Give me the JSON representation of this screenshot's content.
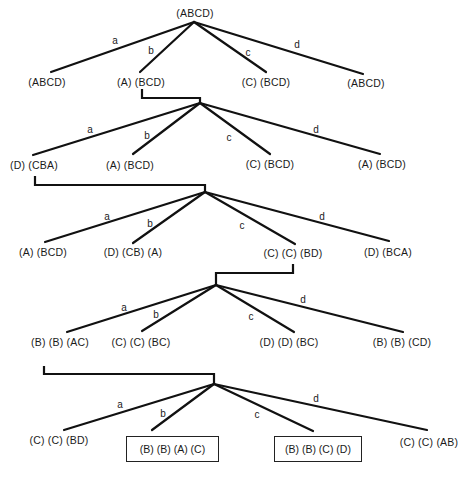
{
  "diagram": {
    "type": "decision-tree",
    "levels": [
      {
        "root": "(ABCD)",
        "branches": [
          {
            "edge": "a",
            "result": "(ABCD)"
          },
          {
            "edge": "b",
            "result": "(A) (BCD)"
          },
          {
            "edge": "c",
            "result": "(C) (BCD)"
          },
          {
            "edge": "d",
            "result": "(ABCD)"
          }
        ],
        "expanded_branch": "b"
      },
      {
        "root": "(A) (BCD)",
        "branches": [
          {
            "edge": "a",
            "result": "(D) (CBA)"
          },
          {
            "edge": "b",
            "result": "(A) (BCD)"
          },
          {
            "edge": "c",
            "result": "(C) (BCD)"
          },
          {
            "edge": "d",
            "result": "(A) (BCD)"
          }
        ],
        "expanded_branch": "a"
      },
      {
        "root": "(D) (CBA)",
        "branches": [
          {
            "edge": "a",
            "result": "(A) (BCD)"
          },
          {
            "edge": "b",
            "result": "(D) (CB) (A)"
          },
          {
            "edge": "c",
            "result": "(C) (C) (BD)"
          },
          {
            "edge": "d",
            "result": "(D) (BCA)"
          }
        ],
        "expanded_branch": "c"
      },
      {
        "root": "(C) (C) (BD)",
        "branches": [
          {
            "edge": "a",
            "result": "(B) (B) (AC)"
          },
          {
            "edge": "b",
            "result": "(C) (C) (BC)"
          },
          {
            "edge": "c",
            "result": "(D) (D) (BC)"
          },
          {
            "edge": "d",
            "result": "(B) (B) (CD)"
          }
        ],
        "expanded_branch": "a"
      },
      {
        "root": "(B) (B) (AC)",
        "branches": [
          {
            "edge": "a",
            "result": "(C) (C) (BD)",
            "boxed": false
          },
          {
            "edge": "b",
            "result": "(B) (B) (A) (C)",
            "boxed": true
          },
          {
            "edge": "c",
            "result": "(B) (B) (C) (D)",
            "boxed": true
          },
          {
            "edge": "d",
            "result": "(C) (C) (AB)",
            "boxed": false
          }
        ]
      }
    ]
  }
}
